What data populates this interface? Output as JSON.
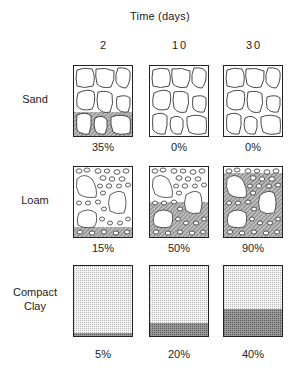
{
  "title": "Time  (days)",
  "columns": [
    {
      "label": "2"
    },
    {
      "label": "10"
    },
    {
      "label": "30"
    }
  ],
  "rows": [
    {
      "label": "Sand",
      "label_lines": [
        "Sand"
      ],
      "values": [
        "35%",
        "0%",
        "0%"
      ],
      "fill_fractions": [
        0.35,
        0.0,
        0.0
      ]
    },
    {
      "label": "Loam",
      "label_lines": [
        "Loam"
      ],
      "values": [
        "15%",
        "50%",
        "90%"
      ],
      "fill_fractions": [
        0.15,
        0.5,
        0.9
      ]
    },
    {
      "label": "Compact Clay",
      "label_lines": [
        "Compact",
        "Clay"
      ],
      "values": [
        "5%",
        "20%",
        "40%"
      ],
      "fill_fractions": [
        0.05,
        0.2,
        0.4
      ]
    }
  ]
}
